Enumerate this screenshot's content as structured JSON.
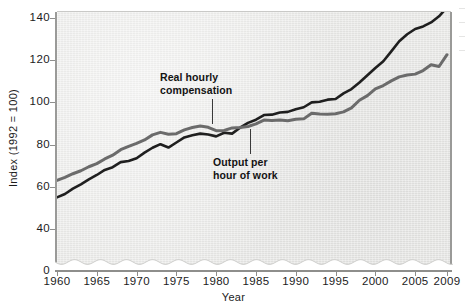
{
  "chart_data": {
    "type": "line",
    "title": "",
    "xlabel": "Year",
    "ylabel": "Index (1992 = 100)",
    "xlim": [
      1960,
      2009
    ],
    "ylim": [
      0,
      148
    ],
    "y_axis_break": {
      "from": 0,
      "to": 40,
      "style": "wavy"
    },
    "grid": false,
    "legend": "inline-annotations",
    "ytick_labels": [
      "0",
      "40",
      "60",
      "80",
      "100",
      "120",
      "140"
    ],
    "ytick_values": [
      0,
      40,
      60,
      80,
      100,
      120,
      140
    ],
    "xtick_labels": [
      "1960",
      "1965",
      "1970",
      "1975",
      "1980",
      "1985",
      "1990",
      "1995",
      "2000",
      "2005",
      "2009"
    ],
    "xtick_values": [
      1960,
      1965,
      1970,
      1975,
      1980,
      1985,
      1990,
      1995,
      2000,
      2005,
      2009
    ],
    "x": [
      1960,
      1961,
      1962,
      1963,
      1964,
      1965,
      1966,
      1967,
      1968,
      1969,
      1970,
      1971,
      1972,
      1973,
      1974,
      1975,
      1976,
      1977,
      1978,
      1979,
      1980,
      1981,
      1982,
      1983,
      1984,
      1985,
      1986,
      1987,
      1988,
      1989,
      1990,
      1991,
      1992,
      1993,
      1994,
      1995,
      1996,
      1997,
      1998,
      1999,
      2000,
      2001,
      2002,
      2003,
      2004,
      2005,
      2006,
      2007,
      2008,
      2009
    ],
    "series": [
      {
        "name": "Real hourly compensation",
        "color": "#6b6b6b",
        "values": [
          63.0,
          64.5,
          66.2,
          67.6,
          69.5,
          71.0,
          73.2,
          75.0,
          77.6,
          79.2,
          80.6,
          82.2,
          84.6,
          85.8,
          84.9,
          85.2,
          87.0,
          88.1,
          88.8,
          88.2,
          86.6,
          86.7,
          87.9,
          88.1,
          88.6,
          89.8,
          91.6,
          91.4,
          91.7,
          91.3,
          92.0,
          92.2,
          94.9,
          94.5,
          94.4,
          94.6,
          95.5,
          97.4,
          101.0,
          103.2,
          106.4,
          108.0,
          110.2,
          112.1,
          113.0,
          113.4,
          115.1,
          117.8,
          117.0,
          122.6
        ]
      },
      {
        "name": "Output per hour of work",
        "color": "#1f1f1f",
        "values": [
          55.0,
          56.6,
          59.1,
          61.2,
          63.5,
          65.6,
          68.0,
          69.3,
          71.7,
          72.2,
          73.5,
          76.2,
          78.5,
          80.2,
          78.6,
          81.0,
          83.4,
          84.4,
          85.2,
          84.8,
          83.9,
          85.6,
          85.2,
          88.0,
          90.3,
          91.8,
          94.0,
          94.2,
          95.2,
          95.5,
          96.8,
          97.7,
          100.0,
          100.3,
          101.3,
          101.6,
          104.3,
          106.3,
          109.4,
          112.9,
          116.3,
          119.5,
          124.2,
          129.0,
          132.3,
          134.8,
          136.0,
          137.9,
          140.8,
          145.0
        ]
      }
    ],
    "annotations": [
      {
        "text_line1": "Real hourly",
        "text_line2": "compensation",
        "target_series": "Real hourly compensation"
      },
      {
        "text_line1": "Output per",
        "text_line2": "hour of work",
        "target_series": "Output per hour of work"
      }
    ]
  },
  "figure": {
    "background_color": "#ffffff",
    "plot_background_color": "#e9e9e7",
    "axis_color": "#8e8e8c"
  }
}
